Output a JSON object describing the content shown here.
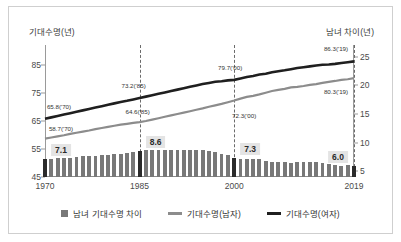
{
  "axis_titles": {
    "left": "기대수명(년)",
    "right": "남녀 차이(년)"
  },
  "legend": {
    "items": [
      {
        "label": "남녀 기대수명 차이",
        "marker": "square",
        "color": "#787878"
      },
      {
        "label": "기대수명(남자)",
        "marker": "line",
        "color": "#8c8c8c"
      },
      {
        "label": "기대수명(여자)",
        "marker": "line",
        "color": "#1f1f1f"
      }
    ]
  },
  "annotations": [
    {
      "text": "65.8('70)",
      "series": "female"
    },
    {
      "text": "58.7('70)",
      "series": "male"
    },
    {
      "text": "73.2('85)",
      "series": "female"
    },
    {
      "text": "64.6('85)",
      "series": "male"
    },
    {
      "text": "79.7('00)",
      "series": "female"
    },
    {
      "text": "72.3('00)",
      "series": "male"
    },
    {
      "text": "86.3('19)",
      "series": "female"
    },
    {
      "text": "80.3('19)",
      "series": "male"
    }
  ],
  "bar_callouts": [
    {
      "text": "7.1",
      "year": 1970
    },
    {
      "text": "8.6",
      "year": 1985
    },
    {
      "text": "7.3",
      "year": 2000
    },
    {
      "text": "6.0",
      "year": 2019
    }
  ],
  "chart_data": {
    "type": "line",
    "title": "",
    "xlabel": "",
    "ylabel": "기대수명(년)",
    "y2label": "남녀 차이(년)",
    "ylim": [
      45,
      90
    ],
    "y2lim": [
      4,
      26
    ],
    "yticks": [
      85,
      75,
      65,
      55,
      45
    ],
    "y2ticks": [
      25,
      20,
      15,
      10,
      5
    ],
    "xticks": [
      1970,
      1985,
      2000,
      2019
    ],
    "grid": false,
    "legend_position": "bottom",
    "x": [
      1970,
      1971,
      1972,
      1973,
      1974,
      1975,
      1976,
      1977,
      1978,
      1979,
      1980,
      1981,
      1982,
      1983,
      1984,
      1985,
      1986,
      1987,
      1988,
      1989,
      1990,
      1991,
      1992,
      1993,
      1994,
      1995,
      1996,
      1997,
      1998,
      1999,
      2000,
      2001,
      2002,
      2003,
      2004,
      2005,
      2006,
      2007,
      2008,
      2009,
      2010,
      2011,
      2012,
      2013,
      2014,
      2015,
      2016,
      2017,
      2018,
      2019
    ],
    "series": [
      {
        "name": "기대수명(여자)",
        "axis": "left",
        "color": "#1f1f1f",
        "values": [
          65.8,
          66.3,
          66.8,
          67.3,
          67.8,
          68.3,
          68.8,
          69.3,
          69.8,
          70.3,
          70.8,
          71.3,
          71.8,
          72.2,
          72.7,
          73.2,
          73.7,
          74.2,
          74.7,
          75.2,
          75.7,
          76.2,
          76.7,
          77.2,
          77.7,
          78.2,
          78.6,
          79.0,
          79.2,
          79.5,
          79.7,
          80.2,
          80.7,
          81.1,
          81.6,
          81.9,
          82.4,
          82.8,
          83.1,
          83.5,
          83.9,
          84.2,
          84.5,
          84.8,
          85.1,
          85.2,
          85.4,
          85.7,
          86.0,
          86.3
        ]
      },
      {
        "name": "기대수명(남자)",
        "axis": "left",
        "color": "#8c8c8c",
        "values": [
          58.7,
          59.1,
          59.5,
          59.9,
          60.4,
          60.8,
          61.2,
          61.6,
          62.1,
          62.5,
          62.9,
          63.3,
          63.7,
          64.0,
          64.3,
          64.6,
          65.0,
          65.5,
          66.0,
          66.5,
          67.0,
          67.5,
          68.0,
          68.5,
          69.0,
          69.5,
          70.1,
          70.6,
          71.1,
          71.7,
          72.3,
          73.0,
          73.6,
          74.0,
          74.5,
          75.1,
          75.7,
          76.1,
          76.5,
          77.0,
          77.2,
          77.5,
          77.9,
          78.2,
          78.6,
          79.0,
          79.3,
          79.7,
          79.9,
          80.3
        ]
      }
    ],
    "bar_series": {
      "name": "남녀 기대수명 차이",
      "axis": "right",
      "color": "#787878",
      "highlight_color": "#2b2b2b",
      "highlight_years": [
        1970,
        1985,
        2000,
        2019
      ],
      "values": [
        7.1,
        7.2,
        7.3,
        7.4,
        7.4,
        7.5,
        7.6,
        7.7,
        7.7,
        7.8,
        7.9,
        8.0,
        8.1,
        8.2,
        8.4,
        8.6,
        8.7,
        8.7,
        8.7,
        8.7,
        8.7,
        8.7,
        8.7,
        8.7,
        8.7,
        8.7,
        8.5,
        8.4,
        8.1,
        7.8,
        7.3,
        7.2,
        7.1,
        7.1,
        7.1,
        6.8,
        6.7,
        6.7,
        6.6,
        6.5,
        6.7,
        6.7,
        6.6,
        6.6,
        6.5,
        6.2,
        6.1,
        6.0,
        6.1,
        6.0
      ]
    }
  }
}
